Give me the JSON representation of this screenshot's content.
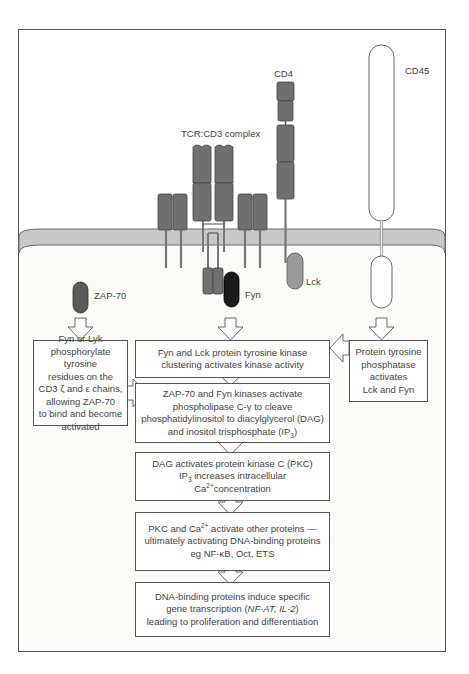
{
  "diagram": {
    "membrane_color": "#c8c8c8",
    "receptor_color": "#707070",
    "fyn_color": "#1a1a1a",
    "lck_color": "#9a9a9a",
    "labels": {
      "cd4": "CD4",
      "cd45": "CD45",
      "tcr_complex": "TCR:CD3 complex",
      "lck": "Lck",
      "fyn": "Fyn",
      "zap70": "ZAP-70"
    },
    "boxes": {
      "zap_phosphorylation": {
        "lines": [
          "Fyn or Lyk",
          "phosphorylate tyrosine",
          "residues on the",
          "CD3 ζ and ε chains,",
          "allowing ZAP-70",
          "to bind and become",
          "activated"
        ]
      },
      "kinase_clustering": {
        "lines": [
          "Fyn and Lck protein tyrosine kinase",
          "clustering activates kinase activity"
        ]
      },
      "phosphatase": {
        "lines": [
          "Protein tyrosine",
          "phosphatase",
          "activates",
          "Lck and Fyn"
        ]
      },
      "plc_activation": {
        "line1": "ZAP-70 and Fyn kinases activate",
        "line2": "phospholipase C-γ to cleave",
        "line3": "phosphatidylinositol to diacylglycerol (DAG)",
        "line4_pre": "and inositol trisphosphate (IP",
        "line4_sub": "3",
        "line4_post": ")"
      },
      "pkc_activation": {
        "line1": "DAG activates protein kinase C (PKC)",
        "line2_pre": "IP",
        "line2_sub": "3",
        "line2_post": " increases intracellular",
        "line3_pre": "Ca",
        "line3_sup": "2+",
        "line3_post": "concentration"
      },
      "dna_binding_activation": {
        "line1_pre": "PKC and Ca",
        "line1_sup": "2+",
        "line1_post": " activate other proteins —",
        "line2": "ultimately activating DNA-binding proteins",
        "line3": "eg NF-κB, Oct, ETS"
      },
      "gene_transcription": {
        "line1": "DNA-binding proteins induce specific",
        "line2_pre": "gene transcription (",
        "line2_italic": "NF-AT, IL-2",
        "line2_post": ")",
        "line3": "leading to proliferation and differentiation"
      }
    }
  }
}
